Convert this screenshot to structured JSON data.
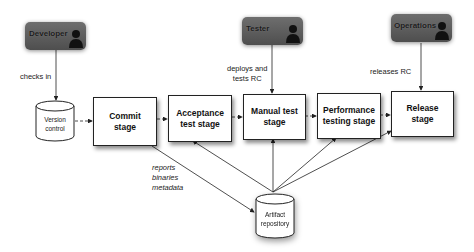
{
  "diagram": {
    "actors": [
      {
        "label": "Developer",
        "icon": "person-icon"
      },
      {
        "label": "Tester",
        "icon": "person-icon"
      },
      {
        "label": "Operations",
        "icon": "person-icon"
      }
    ],
    "actor_actions": {
      "developer": "checks in",
      "tester_line1": "deploys and",
      "tester_line2": "tests RC",
      "operations": "releases RC"
    },
    "repositories": {
      "version_control_line1": "Version",
      "version_control_line2": "control",
      "artifact_line1": "Artifact",
      "artifact_line2": "repository"
    },
    "stages": [
      {
        "line1": "Commit",
        "line2": "stage"
      },
      {
        "line1": "Acceptance",
        "line2": "test stage"
      },
      {
        "line1": "Manual test",
        "line2": "stage"
      },
      {
        "line1": "Performance",
        "line2": "testing stage"
      },
      {
        "line1": "Release",
        "line2": "stage"
      }
    ],
    "artifact_outputs": [
      "reports",
      "binaries",
      "metadata"
    ],
    "colors": {
      "actor_fill": "#5e5e5e",
      "stroke": "#222222",
      "background": "#ffffff"
    }
  }
}
